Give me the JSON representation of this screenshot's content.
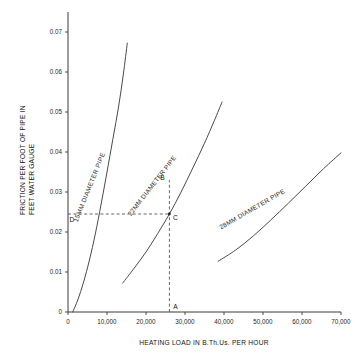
{
  "chart_data": {
    "type": "line",
    "title": "",
    "xlabel": "HEATING LOAD IN B.Th.Us. PER HOUR",
    "ylabel_line1": "FRICTION PER FOOT OF PIPE IN",
    "ylabel_line2": "FEET WATER GAUGE",
    "xlim": [
      0,
      70000
    ],
    "ylim": [
      0,
      0.075
    ],
    "grid": false,
    "legend_position": "inline-curve-labels",
    "xticks": [
      0,
      10000,
      20000,
      30000,
      40000,
      50000,
      60000,
      70000
    ],
    "xticklabels": [
      "0",
      "10,000",
      "20,000",
      "30,000",
      "40,000",
      "50,000",
      "60,000",
      "70,000"
    ],
    "yticks": [
      0,
      0.01,
      0.02,
      0.03,
      0.04,
      0.05,
      0.06,
      0.07
    ],
    "yticklabels": [
      "0",
      "0.01",
      "0.02",
      "0.03",
      "0.04",
      "0.05",
      "0.06",
      "0.07"
    ],
    "series": [
      {
        "name": "15MM DIAMETER PIPE",
        "label": "15MM DIAMETER PIPE",
        "x": [
          1200,
          2500,
          4000,
          5500,
          7000,
          8500,
          10000,
          11500,
          13000,
          14200,
          15200
        ],
        "y": [
          0.0,
          0.003,
          0.0075,
          0.013,
          0.0195,
          0.027,
          0.035,
          0.0432,
          0.0515,
          0.0595,
          0.0672
        ]
      },
      {
        "name": "22MM DIAMETER PIPE",
        "label": "22MM DIAMETER PIPE",
        "x": [
          14000,
          17000,
          20000,
          23000,
          26000,
          29000,
          32000,
          35000,
          37500,
          39500
        ],
        "y": [
          0.0072,
          0.011,
          0.015,
          0.0196,
          0.0245,
          0.03,
          0.036,
          0.0422,
          0.0478,
          0.0525
        ]
      },
      {
        "name": "28MM DIAMETER PIPE",
        "label": "28MM DIAMETER PIPE",
        "x": [
          38500,
          43000,
          47500,
          52000,
          56500,
          61000,
          65500,
          70000
        ],
        "y": [
          0.0127,
          0.0155,
          0.019,
          0.023,
          0.0272,
          0.0315,
          0.0358,
          0.0398
        ]
      }
    ],
    "annotations": [
      {
        "label": "A",
        "x": 26000,
        "y": 0.0,
        "note": "heating load on x-axis"
      },
      {
        "label": "B",
        "x": 26000,
        "y": 0.033,
        "note": "top of vertical construction line"
      },
      {
        "label": "C",
        "x": 26000,
        "y": 0.0245,
        "note": "intersection with 22MM curve"
      },
      {
        "label": "D",
        "x": 0,
        "y": 0.0245,
        "note": "friction value on y-axis"
      }
    ],
    "construction_lines": [
      {
        "type": "vertical",
        "x": 26000,
        "from_y": 0.0,
        "to_y": 0.033,
        "style": "dashed"
      },
      {
        "type": "horizontal",
        "y": 0.0245,
        "from_x": 0,
        "to_x": 26000,
        "style": "dashed"
      }
    ],
    "colors": {
      "curve": "#4a4a4a",
      "axis": "#3a3a3a",
      "dashed": "#555555",
      "text": "#1a1a1a",
      "background": "#ffffff"
    }
  }
}
